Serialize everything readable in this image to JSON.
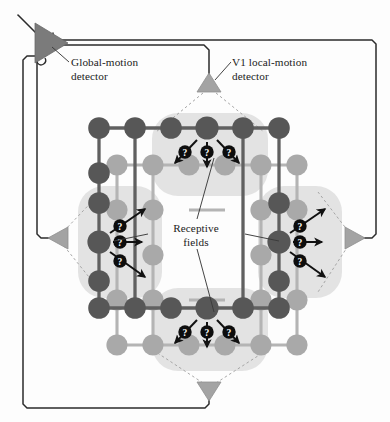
{
  "figure": {
    "background_color": "#fdfdfd"
  },
  "labels": {
    "global_detector": "Global-motion\ndetector",
    "v1_detector": "V1 local-motion\ndetector",
    "receptive_fields": "Receptive\nfields",
    "question_mark": "?"
  },
  "colors": {
    "dark_node": "#575757",
    "light_node": "#a9a9a9",
    "dark_edge": "#5e5e5e",
    "light_edge": "#b0b0b0",
    "blob": "#e2e2e2",
    "triangle_small": "#a0a0a0",
    "triangle_global": "#7b7b7b",
    "wire": "#2b2b2b",
    "dashed": "#9a9a9a",
    "arrow": "#111111",
    "badge": "#0d0d0d",
    "badge_text": "#ffffff",
    "label_text": "#1b1b1b"
  },
  "detectors": [
    {
      "name": "global-motion-detector",
      "shape": "triangle-right",
      "x": 40,
      "y": 43,
      "size": 26,
      "fill": "#7b7b7b"
    },
    {
      "name": "v1-detector-top",
      "shape": "triangle-up",
      "x": 209,
      "y": 86,
      "size": 13,
      "fill": "#a0a0a0"
    },
    {
      "name": "v1-detector-left",
      "shape": "triangle-left",
      "x": 58,
      "y": 238,
      "size": 13,
      "fill": "#a0a0a0"
    },
    {
      "name": "v1-detector-right",
      "shape": "triangle-right",
      "x": 353,
      "y": 238,
      "size": 13,
      "fill": "#a0a0a0"
    },
    {
      "name": "v1-detector-bottom",
      "shape": "triangle-down",
      "x": 209,
      "y": 389,
      "size": 13,
      "fill": "#a0a0a0"
    }
  ],
  "grid": {
    "dark_layer": {
      "origin_x": 99,
      "origin_y": 128,
      "step_x": 36,
      "step_y": 45,
      "cols": 6,
      "rows": 5,
      "radius": 10.5,
      "nodes_present": [
        [
          1,
          1,
          1,
          1,
          1,
          1
        ],
        [
          1,
          0,
          0,
          0,
          0,
          0
        ],
        [
          1,
          0,
          0,
          0,
          1,
          0
        ],
        [
          1,
          0,
          0,
          0,
          1,
          0
        ],
        [
          1,
          1,
          1,
          1,
          1,
          1
        ]
      ]
    },
    "light_layer": {
      "offset_x": 18,
      "offset_y": 37,
      "radius": 10.5,
      "nodes_present": [
        [
          1,
          1,
          1,
          1,
          1,
          1
        ],
        [
          1,
          0,
          0,
          0,
          0,
          0
        ],
        [
          1,
          0,
          0,
          0,
          1,
          0
        ],
        [
          1,
          0,
          0,
          0,
          1,
          0
        ],
        [
          1,
          1,
          1,
          1,
          1,
          1
        ]
      ]
    }
  },
  "receptive_fields": [
    {
      "name": "receptive-field-top",
      "orientation": "horizontal",
      "x": 152,
      "y": 113,
      "w": 116,
      "h": 83,
      "arrow_count": 3,
      "arrow_dirs": [
        "down-left",
        "down",
        "down-right"
      ]
    },
    {
      "name": "receptive-field-bottom",
      "orientation": "horizontal",
      "x": 152,
      "y": 288,
      "w": 116,
      "h": 83,
      "arrow_count": 3,
      "arrow_dirs": [
        "down-left",
        "down",
        "down-right"
      ]
    },
    {
      "name": "receptive-field-left",
      "orientation": "vertical",
      "x": 78,
      "y": 186,
      "w": 84,
      "h": 110,
      "arrow_count": 3,
      "arrow_dirs": [
        "up-right",
        "right",
        "down-right"
      ]
    },
    {
      "name": "receptive-field-right",
      "orientation": "vertical",
      "x": 258,
      "y": 186,
      "w": 84,
      "h": 110,
      "arrow_count": 3,
      "arrow_dirs": [
        "up-right",
        "right",
        "down-right"
      ]
    }
  ],
  "leader_lines": [
    {
      "name": "leader-global",
      "from": [
        69,
        62
      ],
      "to": [
        48,
        48
      ]
    },
    {
      "name": "leader-v1",
      "from": [
        231,
        61
      ],
      "to": [
        214,
        79
      ]
    },
    {
      "name": "leader-rf-up",
      "from": [
        196,
        220
      ],
      "to": [
        214,
        160
      ]
    },
    {
      "name": "leader-rf-dn",
      "from": [
        196,
        248
      ],
      "to": [
        214,
        310
      ]
    },
    {
      "name": "leader-rf-lt",
      "from": [
        148,
        234
      ],
      "to": [
        118,
        240
      ]
    },
    {
      "name": "leader-rf-rt",
      "from": [
        244,
        234
      ],
      "to": [
        275,
        240
      ]
    }
  ],
  "stats": {
    "detector_count": 5,
    "receptive_field_count": 4,
    "arrows_per_field": 3,
    "total_question_badges": 12
  }
}
